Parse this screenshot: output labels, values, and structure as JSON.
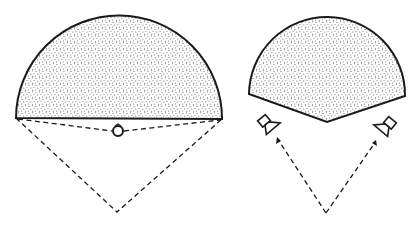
{
  "diagram": {
    "colors": {
      "stroke": "#1a1a1a",
      "stipple": "#555555",
      "background": "#ffffff"
    },
    "panels": [
      {
        "id": "mono",
        "sound_field_shape": "semicircle",
        "sources": 1,
        "source_icon": "circle-speaker"
      },
      {
        "id": "stereo",
        "sound_field_shape": "wedge-sector",
        "sources": 2,
        "source_icon": "cone-speaker"
      }
    ]
  }
}
